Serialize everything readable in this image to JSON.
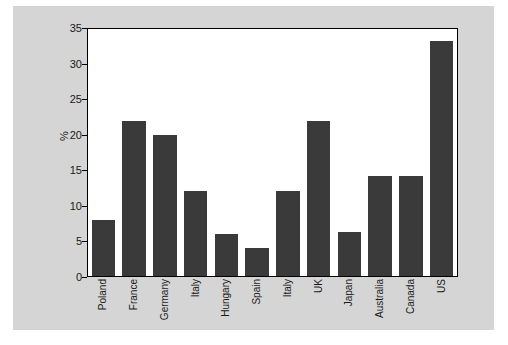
{
  "chart_data": {
    "type": "bar",
    "title": "",
    "subtitle": "",
    "xlabel": "",
    "ylabel": "%",
    "ylim": [
      0,
      35
    ],
    "yticks": [
      0,
      5,
      10,
      15,
      20,
      25,
      30,
      35
    ],
    "ytick_labels": [
      "0",
      "5",
      "10",
      "15",
      "20",
      "25",
      "30",
      "35"
    ],
    "grid": false,
    "legend": null,
    "legend_position": "none",
    "bar_color": "#3a3a3a",
    "plot_background": "#ffffff",
    "figure_background": "#d5d5d5",
    "categories": [
      "Poland",
      "France",
      "Germany",
      "Italy",
      "Hungary",
      "Spain",
      "Italy",
      "UK",
      "Japan",
      "Australia",
      "Canada",
      "US"
    ],
    "values": [
      8,
      22,
      20,
      12,
      6,
      4,
      12,
      22,
      6.2,
      14.2,
      14.2,
      33.3
    ]
  }
}
